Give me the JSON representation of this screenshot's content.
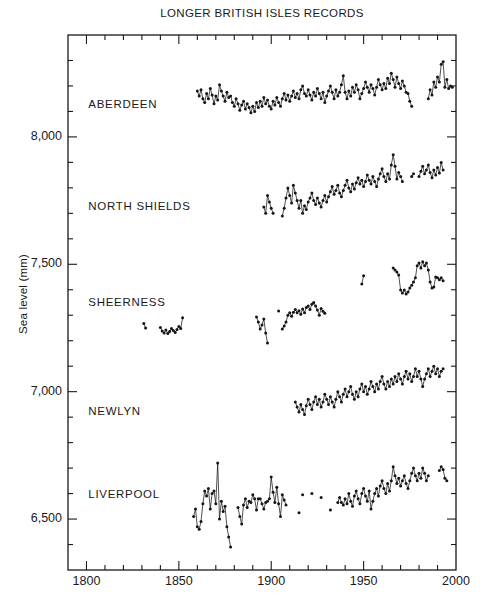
{
  "figure": {
    "background": "#ffffff",
    "ink_color": "#1a1a1a"
  },
  "chart_data": {
    "type": "scatter",
    "title": "LONGER BRITISH ISLES RECORDS",
    "xlabel": "",
    "ylabel": "Sea level (mm)",
    "xlim": [
      1790,
      2000
    ],
    "ylim": [
      6300,
      8400
    ],
    "grid": false,
    "legend": "none (series labelled inside plot)",
    "marker": "small filled dot joined by thin line, gaps where data missing",
    "marker_color": "#151515",
    "x_major_ticks": [
      1800,
      1850,
      1900,
      1950,
      2000
    ],
    "x_tick_labels": [
      "1800",
      "1850",
      "1900",
      "1950",
      "2000"
    ],
    "x_minor_step": 10,
    "y_major_ticks": [
      6500,
      7000,
      7500,
      8000
    ],
    "y_tick_labels": [
      "6,500",
      "7,000",
      "7,500",
      "8,000"
    ],
    "y_minor_step": 100,
    "series": [
      {
        "name": "ABERDEEN",
        "label": {
          "year": 1801,
          "mm": 8125
        },
        "segments": [
          {
            "start": 1860,
            "values": [
              8180,
              8160,
              8185,
              8150,
              8135,
              8170,
              8150,
              8190,
              8165,
              8130,
              8160,
              8145,
              8205,
              8180,
              8160,
              8140,
              8175,
              8155,
              8160,
              8135,
              8120,
              8150,
              8130,
              8105,
              8125,
              8140,
              8110,
              8130,
              8115,
              8095,
              8120,
              8100,
              8135,
              8115,
              8140,
              8120,
              8155,
              8130,
              8145,
              8120,
              8110,
              8140,
              8125,
              8155,
              8135,
              8120,
              8150,
              8170,
              8145,
              8165,
              8140,
              8160,
              8180,
              8155,
              8170,
              8150,
              8185,
              8200,
              8170,
              8160,
              8185,
              8165,
              8145,
              8175,
              8160,
              8190,
              8170,
              8150,
              8175,
              8135,
              8160,
              8180,
              8200,
              8175,
              8150,
              8185,
              8160,
              8175,
              8205,
              8240,
              8175,
              8150,
              8180,
              8160,
              8195,
              8175,
              8205,
              8185,
              8150,
              8170,
              8190,
              8215,
              8195,
              8175,
              8205,
              8190,
              8165,
              8195,
              8225,
              8205,
              8185,
              8210,
              8190,
              8230,
              8210,
              8250,
              8225,
              8195,
              8235,
              8210,
              8190,
              8220,
              8200,
              8175,
              8170,
              8140,
              8120
            ]
          },
          {
            "start": 1985,
            "values": [
              8150,
              8185,
              8165,
              8215,
              8195,
              8235,
              8215,
              8285,
              8295,
              8195,
              8225,
              8190,
              8200,
              8195
            ]
          }
        ]
      },
      {
        "name": "NORTH SHIELDS",
        "label": {
          "year": 1801,
          "mm": 7725
        },
        "segments": [
          {
            "start": 1896,
            "values": [
              7725,
              7700,
              7770,
              7745,
              7720,
              7700
            ]
          },
          {
            "start": 1906,
            "values": [
              7690,
              7720,
              7760,
              7800,
              7770,
              7740,
              7810,
              7780,
              7750,
              7720,
              7750,
              7700,
              7730,
              7715,
              7745,
              7760,
              7780,
              7750,
              7735,
              7760,
              7740,
              7725,
              7750,
              7770,
              7745,
              7765,
              7785,
              7805,
              7775,
              7790,
              7810,
              7780,
              7765,
              7790,
              7810,
              7830,
              7800,
              7785,
              7815,
              7795,
              7820,
              7840,
              7815,
              7830,
              7805,
              7825,
              7850,
              7830,
              7815,
              7845,
              7825,
              7805,
              7835,
              7855,
              7875,
              7845,
              7825,
              7855,
              7835,
              7890,
              7930,
              7885,
              7835,
              7860,
              7845,
              7825
            ]
          },
          {
            "start": 1976,
            "values": [
              7845,
              7855
            ]
          },
          {
            "start": 1980,
            "values": [
              7845,
              7865,
              7885,
              7855,
              7870,
              7890,
              7860,
              7840,
              7870,
              7850,
              7880,
              7858,
              7900,
              7870
            ]
          }
        ]
      },
      {
        "name": "SHEERNESS",
        "label": {
          "year": 1801,
          "mm": 7348
        },
        "segments": [
          {
            "start": 1831,
            "values": [
              7268,
              7250
            ]
          },
          {
            "start": 1840,
            "values": [
              7252,
              7238,
              7230,
              7242,
              7228,
              7236,
              7248,
              7240,
              7232,
              7244,
              7256,
              7248,
              7290
            ]
          },
          {
            "start": 1892,
            "values": [
              7293,
              7273,
              7246,
              7262,
              7285,
              7230,
              7191
            ]
          },
          {
            "start": 1904,
            "values": [
              7317
            ]
          },
          {
            "start": 1906,
            "values": [
              7246,
              7258,
              7273,
              7300,
              7310,
              7296,
              7312,
              7322,
              7310,
              7318,
              7304,
              7325,
              7310,
              7330,
              7336,
              7322,
              7343,
              7350,
              7336,
              7320,
              7300,
              7326,
              7316,
              7308
            ]
          },
          {
            "start": 1949,
            "values": [
              7423,
              7455
            ]
          },
          {
            "start": 1966,
            "values": [
              7485,
              7478,
              7470,
              7458,
              7399,
              7387,
              7399,
              7383,
              7391,
              7407,
              7418,
              7431,
              7447,
              7494,
              7505,
              7486,
              7510,
              7494,
              7505,
              7478,
              7431,
              7407,
              7411,
              7450,
              7447,
              7439,
              7447,
              7435
            ]
          }
        ]
      },
      {
        "name": "NEWLYN",
        "label": {
          "year": 1801,
          "mm": 6920
        },
        "segments": [
          {
            "start": 1913,
            "values": [
              6960,
              6940,
              6920,
              6950,
              6930,
              6910,
              6945,
              6970,
              6950,
              6930,
              6960,
              6980,
              6950,
              6970,
              6940,
              6960,
              6990,
              6970,
              6950,
              6980,
              6960,
              6940,
              6970,
              7000,
              6980,
              6960,
              6990,
              7010,
              6980,
              7000,
              7020,
              6990,
              6970,
              7000,
              6980,
              7010,
              7030,
              7000,
              7020,
              6990,
              7010,
              7040,
              7020,
              7000,
              7030,
              7010,
              7040,
              7060,
              7030,
              7010,
              7040,
              7020,
              7050,
              7030,
              7060,
              7040,
              7070,
              7050,
              7030,
              7060,
              7080,
              7050,
              7070,
              7040,
              7060,
              7090,
              7060,
              7080,
              7050,
              7020,
              7050,
              7070,
              7090,
              7060,
              7080,
              7100,
              7070,
              7090,
              7060,
              7080,
              7090
            ]
          }
        ]
      },
      {
        "name": "LIVERPOOL",
        "label": {
          "year": 1801,
          "mm": 6594
        },
        "segments": [
          {
            "start": 1858,
            "values": [
              6510,
              6540,
              6470,
              6460,
              6490,
              6560,
              6610,
              6590,
              6620,
              6540,
              6600,
              6610,
              6560,
              6720,
              6500,
              6570,
              6530,
              6550,
              6470,
              6430,
              6390
            ]
          },
          {
            "start": 1882,
            "values": [
              6545,
              6510,
              6480,
              6555,
              6580,
              6545,
              6570,
              6565,
              6595,
              6580,
              6535,
              6580,
              6580,
              6560,
              6540,
              6565,
              6570,
              6580,
              6665,
              6605,
              6565,
              6625,
              6560,
              6510,
              6595,
              6575,
              6555
            ]
          },
          {
            "start": 1915,
            "values": [
              6525
            ]
          },
          {
            "start": 1917,
            "values": [
              6595
            ]
          },
          {
            "start": 1922,
            "values": [
              6600
            ]
          },
          {
            "start": 1927,
            "values": [
              6585
            ]
          },
          {
            "start": 1932,
            "values": [
              6535
            ]
          },
          {
            "start": 1936,
            "values": [
              6565,
              6585,
              6565,
              6555,
              6580,
              6560,
              6600,
              6570,
              6550,
              6590,
              6610,
              6580,
              6560,
              6600,
              6620,
              6590,
              6570,
              6610,
              6540,
              6570,
              6600,
              6620,
              6590,
              6630,
              6650,
              6620,
              6600,
              6640,
              6610,
              6650,
              6705,
              6670,
              6640,
              6660,
              6630,
              6650,
              6670,
              6640,
              6620,
              6650,
              6680,
              6700,
              6670,
              6650,
              6680,
              6660,
              6700,
              6680,
              6650,
              6670
            ]
          },
          {
            "start": 1991,
            "values": [
              6690,
              6705,
              6695,
              6660,
              6650
            ]
          }
        ]
      }
    ]
  }
}
